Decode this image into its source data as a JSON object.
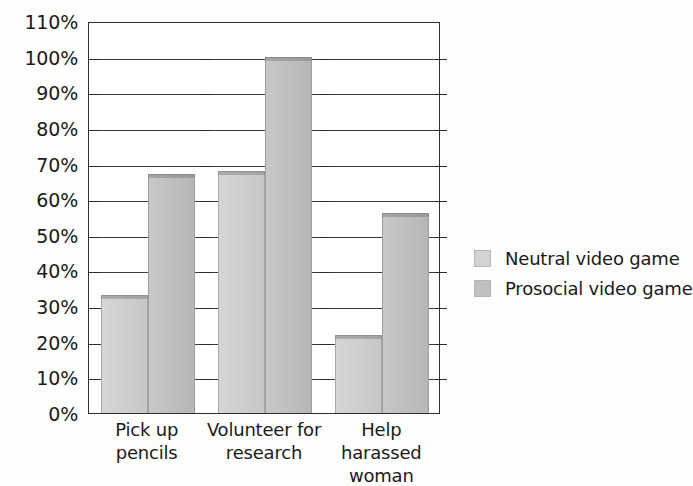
{
  "chart_data": {
    "type": "bar",
    "title": "",
    "subtitle": "",
    "xlabel": "",
    "ylabel": "",
    "ylim": [
      0,
      110
    ],
    "ytick_step": 10,
    "ytick_labels": [
      "0%",
      "10%",
      "20%",
      "30%",
      "40%",
      "50%",
      "60%",
      "70%",
      "80%",
      "90%",
      "100%",
      "110%"
    ],
    "grid": true,
    "legend_position": "right",
    "categories": [
      "Pick up pencils",
      "Volunteer for research",
      "Help harassed woman"
    ],
    "category_label_lines": [
      [
        "Pick up pencils"
      ],
      [
        "Volunteer for",
        "research"
      ],
      [
        "Help harassed",
        "woman"
      ]
    ],
    "series": [
      {
        "name": "Neutral video game",
        "color": "#d3d3d3",
        "values": [
          33,
          68,
          22
        ]
      },
      {
        "name": "Prosocial video game",
        "color": "#c0c0c0",
        "values": [
          67,
          100,
          56
        ]
      }
    ]
  },
  "legend": {
    "items": [
      {
        "label": "Neutral video game",
        "swatch": "neutral"
      },
      {
        "label": "Prosocial video game",
        "swatch": "prosocial"
      }
    ]
  }
}
